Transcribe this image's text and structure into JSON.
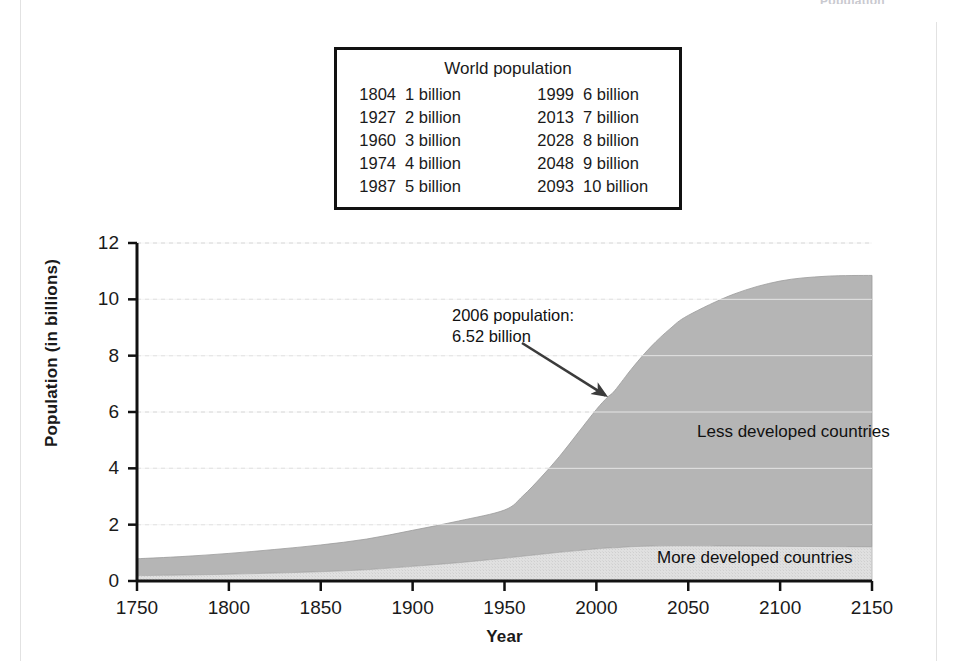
{
  "running_head": "Population",
  "world_population_box": {
    "title": "World population",
    "rows": [
      {
        "year_left": "1804",
        "value_left": "1 billion",
        "year_right": "1999",
        "value_right": "6 billion"
      },
      {
        "year_left": "1927",
        "value_left": "2 billion",
        "year_right": "2013",
        "value_right": "7 billion"
      },
      {
        "year_left": "1960",
        "value_left": "3 billion",
        "year_right": "2028",
        "value_right": "8 billion"
      },
      {
        "year_left": "1974",
        "value_left": "4 billion",
        "year_right": "2048",
        "value_right": "9 billion"
      },
      {
        "year_left": "1987",
        "value_left": "5 billion",
        "year_right": "2093",
        "value_right": "10 billion"
      }
    ]
  },
  "annotation": {
    "line1": "2006 population:",
    "line2": "6.52 billion"
  },
  "chart_data": {
    "type": "area",
    "title": "",
    "xlabel": "Year",
    "ylabel": "Population (in billions)",
    "xlim": [
      1750,
      2150
    ],
    "ylim": [
      0,
      12
    ],
    "xticks": [
      1750,
      1800,
      1850,
      1900,
      1950,
      2000,
      2050,
      2100,
      2150
    ],
    "yticks": [
      0,
      2,
      4,
      6,
      8,
      10,
      12
    ],
    "grid": "horizontal-dashed",
    "legend": "inline-labels",
    "stacked": true,
    "colors": {
      "less_developed": "#b5b5b5",
      "more_developed": "#dedede",
      "axis": "#111111",
      "grid": "#c8c8c8"
    },
    "x": [
      1750,
      1775,
      1800,
      1825,
      1850,
      1875,
      1900,
      1925,
      1950,
      1960,
      1970,
      1980,
      1990,
      2000,
      2006,
      2010,
      2020,
      2030,
      2040,
      2050,
      2075,
      2100,
      2125,
      2150
    ],
    "series": [
      {
        "name": "More developed countries",
        "values": [
          0.19,
          0.21,
          0.24,
          0.28,
          0.33,
          0.4,
          0.52,
          0.65,
          0.81,
          0.88,
          0.95,
          1.02,
          1.08,
          1.14,
          1.17,
          1.18,
          1.22,
          1.24,
          1.25,
          1.25,
          1.24,
          1.23,
          1.22,
          1.21
        ]
      },
      {
        "name": "Less developed countries",
        "values": [
          0.6,
          0.66,
          0.74,
          0.84,
          0.95,
          1.09,
          1.28,
          1.48,
          1.71,
          2.14,
          2.74,
          3.41,
          4.18,
          4.95,
          5.35,
          5.58,
          6.38,
          7.1,
          7.7,
          8.18,
          8.95,
          9.42,
          9.6,
          9.64
        ]
      }
    ],
    "annotations": [
      {
        "text": "2006 population: 6.52 billion",
        "x": 2006,
        "y": 6.52
      }
    ]
  }
}
